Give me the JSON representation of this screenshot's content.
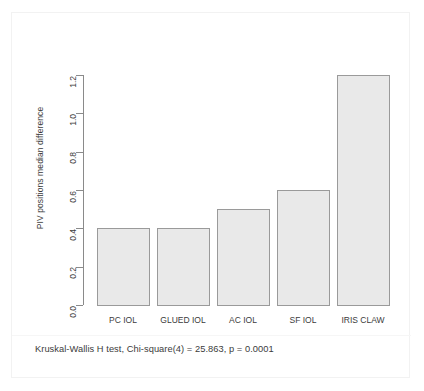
{
  "chart_data": {
    "type": "bar",
    "title": "",
    "subtitle": "",
    "xlabel": "",
    "ylabel": "PIV positions median difference",
    "categories": [
      "PC IOL",
      "GLUED IOL",
      "AC IOL",
      "SF IOL",
      "IRIS CLAW"
    ],
    "values": [
      0.4,
      0.4,
      0.5,
      0.6,
      1.2
    ],
    "ylim": [
      0.0,
      1.2
    ],
    "yticks": [
      "0.0",
      "0.2",
      "0.4",
      "0.6",
      "0.8",
      "1.0",
      "1.2"
    ],
    "ytick_values": [
      0.0,
      0.2,
      0.4,
      0.6,
      0.8,
      1.0,
      1.2
    ],
    "grid": false,
    "legend": "none",
    "annotation": "Kruskal-Wallis H test, Chi-square(4) = 25.863, p = 0.0001",
    "bar_fill_color": "#e9e9e9",
    "bar_border_color": "#9a9a9a",
    "axis_color": "#8a8a8a",
    "text_color": "#3b3b3b",
    "background_color": "#ffffff"
  },
  "figure": {
    "caption": "Kruskal-Wallis H test, Chi-square(4) = 25.863, p = 0.0001"
  }
}
